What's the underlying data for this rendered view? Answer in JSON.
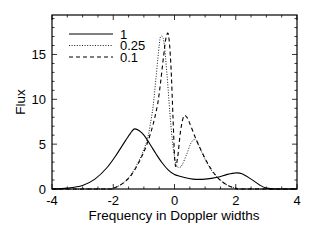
{
  "chart_data": {
    "type": "line",
    "title": "",
    "xlabel": "Frequency in Doppler widths",
    "ylabel": "Flux",
    "xlim": [
      -4,
      4
    ],
    "ylim": [
      0,
      19.4
    ],
    "xticks": [
      -4,
      -2,
      0,
      2,
      4
    ],
    "yticks": [
      0,
      5,
      10,
      15
    ],
    "grid": false,
    "legend_position": "upper left",
    "series": [
      {
        "name": "1",
        "style": "solid",
        "x": [
          -4.0,
          -3.5,
          -3.0,
          -2.6,
          -2.2,
          -1.9,
          -1.6,
          -1.4,
          -1.3,
          -1.15,
          -1.0,
          -0.8,
          -0.6,
          -0.4,
          -0.2,
          0.0,
          0.3,
          0.6,
          1.0,
          1.4,
          1.7,
          2.0,
          2.2,
          2.5,
          2.8,
          3.0,
          3.3,
          4.0
        ],
        "y": [
          0.0,
          0.1,
          0.4,
          1.1,
          2.4,
          3.8,
          5.4,
          6.4,
          6.7,
          6.5,
          6.0,
          5.0,
          3.9,
          2.9,
          2.1,
          1.6,
          1.3,
          1.1,
          1.1,
          1.3,
          1.6,
          1.8,
          1.7,
          1.1,
          0.4,
          0.1,
          0.0,
          0.0
        ]
      },
      {
        "name": "0.25",
        "style": "dotted",
        "x": [
          -4.0,
          -2.2,
          -2.0,
          -1.7,
          -1.4,
          -1.1,
          -0.9,
          -0.8,
          -0.7,
          -0.6,
          -0.5,
          -0.45,
          -0.35,
          -0.25,
          -0.15,
          -0.05,
          0.05,
          0.15,
          0.25,
          0.4,
          0.55,
          0.7,
          0.85,
          1.0,
          1.2,
          1.4,
          1.6,
          1.8,
          2.0,
          2.2,
          4.0
        ],
        "y": [
          0.0,
          0.0,
          0.1,
          0.6,
          1.7,
          3.6,
          5.4,
          7.0,
          9.2,
          12.5,
          16.0,
          17.0,
          16.5,
          13.0,
          8.5,
          4.8,
          2.8,
          2.4,
          2.7,
          3.9,
          5.2,
          5.5,
          4.4,
          3.3,
          2.1,
          1.3,
          0.7,
          0.3,
          0.1,
          0.0,
          0.0
        ]
      },
      {
        "name": "0.1",
        "style": "dashed",
        "x": [
          -4.0,
          -2.2,
          -2.0,
          -1.7,
          -1.4,
          -1.1,
          -0.9,
          -0.7,
          -0.55,
          -0.45,
          -0.35,
          -0.28,
          -0.2,
          -0.12,
          -0.05,
          0.02,
          0.1,
          0.2,
          0.3,
          0.4,
          0.5,
          0.65,
          0.8,
          1.0,
          1.2,
          1.4,
          1.6,
          1.8,
          2.0,
          2.2,
          4.0
        ],
        "y": [
          0.0,
          0.0,
          0.1,
          0.6,
          1.6,
          3.4,
          5.0,
          7.2,
          9.5,
          12.0,
          15.0,
          16.8,
          17.2,
          14.0,
          8.0,
          2.8,
          3.5,
          6.5,
          8.1,
          8.0,
          7.3,
          6.0,
          4.8,
          3.4,
          2.2,
          1.3,
          0.7,
          0.3,
          0.1,
          0.0,
          0.0
        ]
      }
    ]
  }
}
